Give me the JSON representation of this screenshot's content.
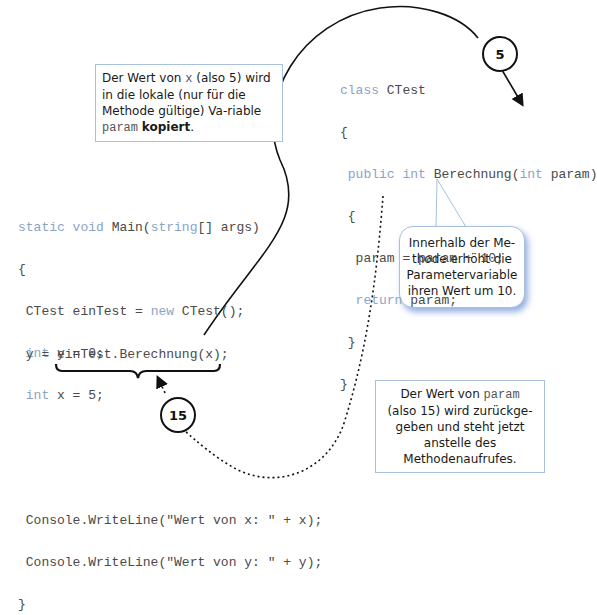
{
  "colors": {
    "keyword": "#8aa4c8",
    "code_text": "#4a4a4a",
    "box_border": "#a9c0dc",
    "bubble_shadow": "#3c6ec8",
    "arrow": "#111111"
  },
  "note_copy": {
    "part1": "Der Wert von ",
    "var_x": "x",
    "part2": " (also 5) wird in die lokale (nur für die Methode gültige) Va-riable ",
    "var_param": "param",
    "part3": " ",
    "bold": "kopiert",
    "part4": "."
  },
  "note_return": {
    "part1": "Der Wert von ",
    "var_param": "param",
    "part2": "(also 15) wird zurückge-geben und steht jetzt anstelle des Methodenaufrufes."
  },
  "bubble_increment": {
    "text": "Innerhalb der Me-thode erhöht die Parametervariable ihren Wert um 10."
  },
  "badges": {
    "passed_value": "5",
    "returned_value": "15"
  },
  "class_code": {
    "line1_kw": "class",
    "line1_rest": " CTest",
    "line2": "{",
    "line3_kw1": " public",
    "line3_kw2": " int",
    "line3_mid": " Berechnung(",
    "line3_kw3": "int",
    "line3_rest": " param)",
    "line4": " {",
    "line5": "  param = param + 10;",
    "line6_kw": "  return",
    "line6_rest": " param;",
    "line7": " }",
    "line8": "}"
  },
  "main_code": {
    "line1_kw1": "static",
    "line1_kw2": " void",
    "line1_mid": " Main(",
    "line1_kw3": "string",
    "line1_rest": "[] args)",
    "line2": "{",
    "line3_a": " CTest einTest = ",
    "line3_kw": "new",
    "line3_b": " CTest();",
    "line4_kw": " int",
    "line4_rest": " y = 0;",
    "line5_kw": " int",
    "line5_rest": " x = 5;",
    "call_line": " y = einTest.Berechnung(x);",
    "out1": " Console.WriteLine(\"Wert von x: \" + x);",
    "out2": " Console.WriteLine(\"Wert von y: \" + y);",
    "close": "}"
  }
}
